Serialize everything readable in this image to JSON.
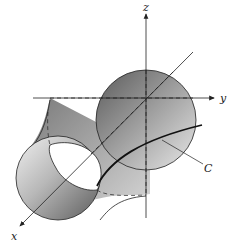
{
  "figure": {
    "axes": {
      "x_label": "x",
      "y_label": "y",
      "z_label": "z"
    },
    "curve": {
      "label": "C"
    },
    "colors": {
      "stroke": "#222222",
      "shade_dark": "#6e6e6e",
      "shade_light": "#e4e4e4",
      "background": "#ffffff"
    }
  }
}
